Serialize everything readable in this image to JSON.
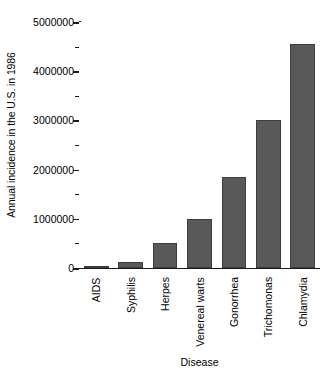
{
  "chart_data": {
    "type": "bar",
    "title": "",
    "xlabel": "Disease",
    "ylabel": "Annual incidence in the U.S. in 1986",
    "categories": [
      "AIDS",
      "Syphilis",
      "Herpes",
      "Venereal warts",
      "Gonorrhea",
      "Trichomonas",
      "Chlamydia"
    ],
    "values": [
      5000,
      130000,
      500000,
      1000000,
      1850000,
      3000000,
      4550000
    ],
    "ylim": [
      0,
      5000000
    ],
    "ytick_labels": [
      "0",
      "1000000",
      "2000000",
      "3000000",
      "4000000",
      "5000000"
    ],
    "ytick_values": [
      0,
      1000000,
      2000000,
      3000000,
      4000000,
      5000000
    ],
    "yminor_tick_values": [
      500000,
      1500000,
      2500000,
      3500000,
      4500000
    ],
    "grid": false,
    "legend": null,
    "bar_color": "#595959",
    "bar_edge_color": "#3d3d3d",
    "axis_color": "#1a1a1a",
    "background_color": "#ffffff"
  }
}
